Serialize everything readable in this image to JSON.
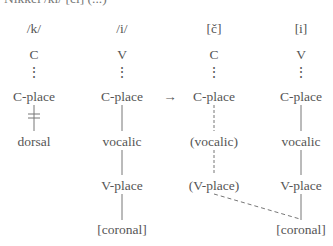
{
  "cut_off_header": "Nikkei /ki/ [či]   (...)",
  "arrow": "→",
  "columns": [
    {
      "segment": "/k/",
      "root": "C",
      "dots": "⋮",
      "cplace": "C-place",
      "dependent": "dorsal"
    },
    {
      "segment": "/i/",
      "root": "V",
      "dots": "⋮",
      "cplace": "C-place",
      "vocalic": "vocalic",
      "vplace": "V-place",
      "feature": "[coronal]"
    },
    {
      "segment": "[č]",
      "root": "C",
      "dots": "⋮",
      "cplace": "C-place",
      "vocalic": "(vocalic)",
      "vplace": "(V-place)"
    },
    {
      "segment": "[i]",
      "root": "V",
      "dots": "⋮",
      "cplace": "C-place",
      "vocalic": "vocalic",
      "vplace": "V-place",
      "feature": "[coronal]"
    }
  ]
}
